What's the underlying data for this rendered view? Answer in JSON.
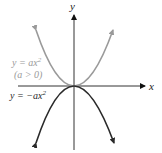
{
  "diagram": {
    "axes": {
      "x_label": "x",
      "y_label": "y"
    },
    "curves": [
      {
        "id": "upward",
        "equation_prefix": "y = ax",
        "exponent": "2",
        "condition": "(a > 0)",
        "color": "#9a9a9a"
      },
      {
        "id": "downward",
        "equation_prefix": "y = −ax",
        "exponent": "2",
        "color": "#2a2a2a"
      }
    ]
  }
}
